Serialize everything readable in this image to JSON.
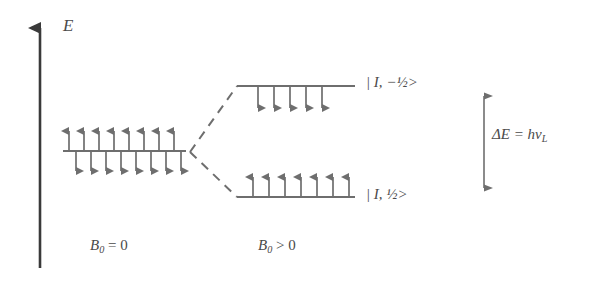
{
  "diagram": {
    "axis": {
      "label": "E",
      "name": "energy-axis"
    },
    "stroke_color": "#6e6e6e",
    "text_color": "#4a4a4a",
    "levels": [
      {
        "id": "degenerate",
        "field_condition": "B0 = 0",
        "arrows_up": 8,
        "arrows_down": 8,
        "label": ""
      },
      {
        "id": "upper",
        "field_condition": "B0 > 0",
        "arrows_up": 0,
        "arrows_down": 5,
        "label": "| I, −½>"
      },
      {
        "id": "lower",
        "field_condition": "B0 > 0",
        "arrows_up": 7,
        "arrows_down": 0,
        "label": "| I, ½>"
      }
    ],
    "annotations": {
      "splitting_prefix": "ΔE = h",
      "splitting_nu": "ν",
      "splitting_sub": "L",
      "splitting_full": "ΔE = hν_L"
    },
    "axis_conditions": {
      "left_symbol": "B",
      "left_sub": "0",
      "left_rest": " = 0",
      "right_symbol": "B",
      "right_sub": "0",
      "right_rest": " > 0"
    }
  }
}
